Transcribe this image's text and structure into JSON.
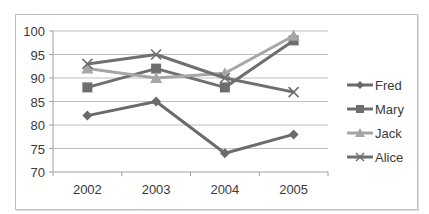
{
  "chart_data": {
    "type": "line",
    "title": "",
    "xlabel": "",
    "ylabel": "",
    "categories": [
      "2002",
      "2003",
      "2004",
      "2005"
    ],
    "ylim": [
      70,
      100
    ],
    "yticks": [
      70,
      75,
      80,
      85,
      90,
      95,
      100
    ],
    "grid": true,
    "legend_position": "right",
    "series": [
      {
        "name": "Fred",
        "marker": "diamond",
        "color": "#6b6b6b",
        "values": [
          82,
          85,
          74,
          78
        ]
      },
      {
        "name": "Mary",
        "marker": "square",
        "color": "#6e6e6e",
        "values": [
          88,
          92,
          88,
          98
        ]
      },
      {
        "name": "Jack",
        "marker": "triangle",
        "color": "#a6a6a6",
        "values": [
          92,
          90,
          91,
          99
        ]
      },
      {
        "name": "Alice",
        "marker": "x",
        "color": "#6f6f6f",
        "values": [
          93,
          95,
          90,
          87
        ]
      }
    ]
  }
}
